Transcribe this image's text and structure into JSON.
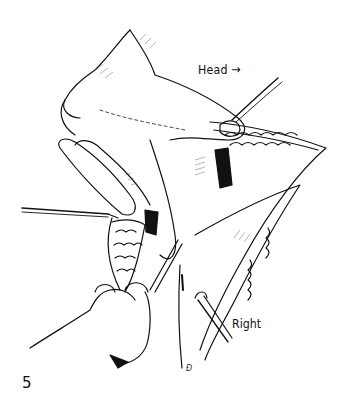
{
  "illustration": {
    "description": "Surgical line drawing: hand retracting tissue within an incision, with probes and forceps",
    "labels": {
      "head": "Head",
      "head_arrow": "→",
      "right": "Right"
    },
    "figure_number": "5",
    "signature": "Đ",
    "colors": {
      "ink": "#111111",
      "background": "#ffffff"
    }
  }
}
